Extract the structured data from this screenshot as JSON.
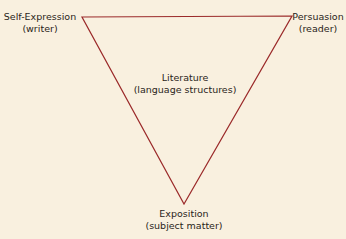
{
  "diagram": {
    "type": "triangle",
    "line_color": "#9b2a2a",
    "background": "#f9f0df",
    "vertices": {
      "top_left": {
        "title": "Self-Expression",
        "subtitle": "(writer)"
      },
      "top_right": {
        "title": "Persuasion",
        "subtitle": "(reader)"
      },
      "bottom": {
        "title": "Exposition",
        "subtitle": "(subject matter)"
      }
    },
    "center": {
      "title": "Literature",
      "subtitle": "(language structures)"
    }
  }
}
